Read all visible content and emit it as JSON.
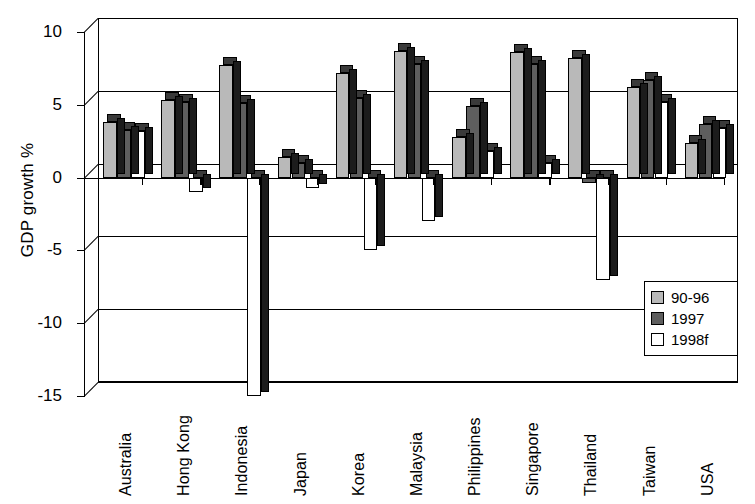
{
  "chart_data": {
    "type": "bar",
    "title": "",
    "xlabel": "",
    "ylabel": "GDP growth %",
    "ylim": [
      -15,
      10
    ],
    "yticks": [
      10,
      5,
      0,
      -5,
      -10,
      -15
    ],
    "ytick_labels": [
      "10",
      "5",
      "0",
      "-5",
      "-10",
      "-15"
    ],
    "grid": true,
    "legend_position": "inside-bottom-right",
    "categories": [
      "Australia",
      "Hong Kong",
      "Indonesia",
      "Japan",
      "Korea",
      "Malaysia",
      "Philippines",
      "Singapore",
      "Thailand",
      "Taiwan",
      "USA"
    ],
    "series": [
      {
        "name": "90-96",
        "color": "#b9b9b9",
        "values": [
          3.8,
          5.3,
          7.7,
          1.4,
          7.2,
          8.7,
          2.8,
          8.6,
          8.2,
          6.2,
          2.4
        ]
      },
      {
        "name": "1997",
        "color": "#5e5e5e",
        "values": [
          3.3,
          5.2,
          5.1,
          1.0,
          5.5,
          7.8,
          4.9,
          7.8,
          -0.4,
          6.7,
          3.7
        ]
      },
      {
        "name": "1998f",
        "color": "#ffffff",
        "values": [
          3.2,
          -1.0,
          -15.0,
          -0.7,
          -5.0,
          -3.0,
          1.8,
          1.0,
          -7.0,
          5.2,
          3.4
        ]
      }
    ]
  },
  "legend": {
    "items": [
      {
        "label": "90-96"
      },
      {
        "label": "1997"
      },
      {
        "label": "1998f"
      }
    ]
  }
}
